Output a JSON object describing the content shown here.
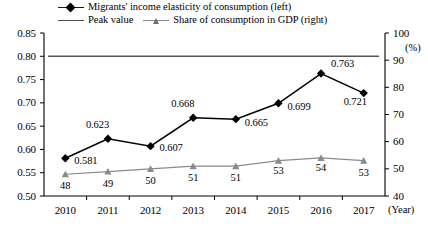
{
  "chart_data": {
    "type": "line",
    "title": "",
    "xlabel": "(Year)",
    "ylabel": "",
    "y2label": "(%)",
    "categories": [
      "2010",
      "2011",
      "2012",
      "2013",
      "2014",
      "2015",
      "2016",
      "2017"
    ],
    "ylim": [
      0.5,
      0.85
    ],
    "y2lim": [
      40,
      100
    ],
    "yticks": [
      "0.50",
      "0.55",
      "0.60",
      "0.65",
      "0.70",
      "0.75",
      "0.80",
      "0.85"
    ],
    "y2ticks": [
      "40",
      "50",
      "60",
      "70",
      "80",
      "90",
      "100"
    ],
    "grid": false,
    "legend_position": "top",
    "series": [
      {
        "name": "Migrants' income elasticity of consumption (left)",
        "axis": "left",
        "marker": "diamond",
        "color": "#000000",
        "values": [
          0.581,
          0.623,
          0.607,
          0.668,
          0.665,
          0.699,
          0.763,
          0.721
        ],
        "labels": [
          "0.581",
          "0.623",
          "0.607",
          "0.668",
          "0.665",
          "0.699",
          "0.763",
          "0.721"
        ],
        "label_offsets": [
          {
            "dx": 9,
            "dy": 3
          },
          {
            "dx": 0,
            "dy": -14
          },
          {
            "dx": 9,
            "dy": 2
          },
          {
            "dx": 0,
            "dy": -14
          },
          {
            "dx": 9,
            "dy": 4
          },
          {
            "dx": 9,
            "dy": 4
          },
          {
            "dx": 10,
            "dy": -10
          },
          {
            "dx": 2,
            "dy": 9
          }
        ]
      },
      {
        "name": "Share of consumption in GDP (right)",
        "axis": "right",
        "marker": "triangle",
        "color": "#8a8a8a",
        "values": [
          48,
          49,
          50,
          51,
          51,
          53,
          54,
          53
        ],
        "labels": [
          "48",
          "49",
          "50",
          "51",
          "51",
          "53",
          "54",
          "53"
        ],
        "label_offsets": [
          {
            "dx": 0,
            "dy": 12
          },
          {
            "dx": 0,
            "dy": 12
          },
          {
            "dx": 0,
            "dy": 12
          },
          {
            "dx": 0,
            "dy": 12
          },
          {
            "dx": 0,
            "dy": 12
          },
          {
            "dx": 0,
            "dy": 10
          },
          {
            "dx": 0,
            "dy": 10
          },
          {
            "dx": 0,
            "dy": 12
          }
        ]
      },
      {
        "name": "Peak value",
        "axis": "left",
        "marker": "none",
        "color": "#555555",
        "constant": 0.8
      }
    ]
  },
  "legend": {
    "row1": [
      {
        "label": "Migrants' income elasticity of consumption (left)",
        "marker": "diamond-line"
      }
    ],
    "row2": [
      {
        "label": "Peak value",
        "marker": "plain-line"
      },
      {
        "label": "Share of consumption in GDP (right)",
        "marker": "triangle-line"
      }
    ]
  }
}
